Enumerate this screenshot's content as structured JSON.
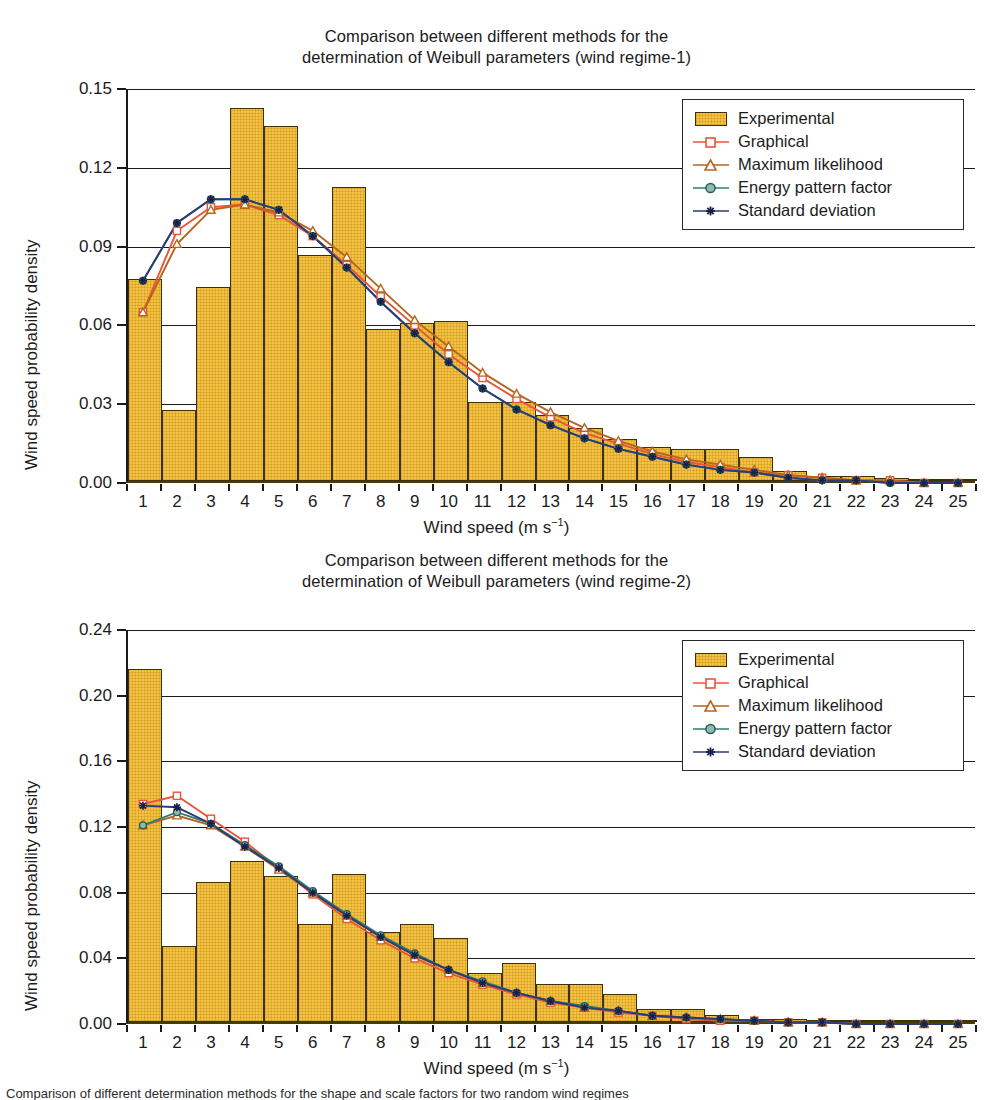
{
  "figure": {
    "caption": "Comparison of different determination methods for the shape and scale factors for two random wind regimes"
  },
  "legend": {
    "entries": [
      {
        "label": "Experimental",
        "type": "bar",
        "color": "#f5c243"
      },
      {
        "label": "Graphical",
        "type": "line",
        "color": "#e8553a",
        "marker": "open-square"
      },
      {
        "label": "Maximum likelihood",
        "type": "line",
        "color": "#b5651d",
        "marker": "open-triangle"
      },
      {
        "label": "Energy pattern factor",
        "type": "line",
        "color": "#2e7d74",
        "marker": "filled-circle"
      },
      {
        "label": "Standard deviation",
        "type": "line",
        "color": "#2b3a78",
        "marker": "asterisk"
      }
    ]
  },
  "chart_data": [
    {
      "type": "bar",
      "id": "wind-regime-1",
      "title": "Comparison between different methods for the determination of Weibull parameters (wind regime-1)",
      "title_line1": "Comparison between different methods for the",
      "title_line2": "determination of Weibull parameters (wind regime-1)",
      "xlabel": "Wind speed (m s−1)",
      "ylabel": "Wind speed probability density",
      "xlim": [
        0,
        25
      ],
      "ylim": [
        0.0,
        0.15
      ],
      "yticks": [
        "0.00",
        "0.03",
        "0.06",
        "0.09",
        "0.12",
        "0.15"
      ],
      "ytick_values": [
        0.0,
        0.03,
        0.06,
        0.09,
        0.12,
        0.15
      ],
      "grid": true,
      "legend_position": "top-right",
      "categories": [
        1,
        2,
        3,
        4,
        5,
        6,
        7,
        8,
        9,
        10,
        11,
        12,
        13,
        14,
        15,
        16,
        17,
        18,
        19,
        20,
        21,
        22,
        23,
        24,
        25
      ],
      "values": [
        0.077,
        0.027,
        0.074,
        0.142,
        0.135,
        0.086,
        0.112,
        0.058,
        0.06,
        0.061,
        0.03,
        0.03,
        0.025,
        0.02,
        0.016,
        0.013,
        0.012,
        0.012,
        0.009,
        0.004,
        0.002,
        0.002,
        0.001,
        0.0,
        0.0
      ],
      "series": [
        {
          "name": "Graphical",
          "color": "#e8553a",
          "marker": "open-square",
          "values": [
            0.065,
            0.096,
            0.105,
            0.106,
            0.102,
            0.094,
            0.083,
            0.071,
            0.06,
            0.049,
            0.04,
            0.032,
            0.025,
            0.019,
            0.015,
            0.011,
            0.008,
            0.006,
            0.004,
            0.003,
            0.002,
            0.001,
            0.001,
            0.0,
            0.0
          ]
        },
        {
          "name": "Maximum likelihood",
          "color": "#b5651d",
          "marker": "open-triangle",
          "values": [
            0.065,
            0.091,
            0.104,
            0.106,
            0.103,
            0.096,
            0.086,
            0.074,
            0.062,
            0.052,
            0.042,
            0.034,
            0.027,
            0.021,
            0.016,
            0.012,
            0.009,
            0.007,
            0.005,
            0.003,
            0.002,
            0.001,
            0.001,
            0.0,
            0.0
          ]
        },
        {
          "name": "Energy pattern factor",
          "color": "#2e7d74",
          "marker": "filled-circle",
          "values": [
            0.077,
            0.099,
            0.108,
            0.108,
            0.104,
            0.094,
            0.082,
            0.069,
            0.057,
            0.046,
            0.036,
            0.028,
            0.022,
            0.017,
            0.013,
            0.01,
            0.007,
            0.005,
            0.004,
            0.002,
            0.001,
            0.001,
            0.0,
            0.0,
            0.0
          ]
        },
        {
          "name": "Standard deviation",
          "color": "#2b3a78",
          "marker": "asterisk",
          "values": [
            0.077,
            0.099,
            0.108,
            0.108,
            0.104,
            0.094,
            0.082,
            0.069,
            0.057,
            0.046,
            0.036,
            0.028,
            0.022,
            0.017,
            0.013,
            0.01,
            0.007,
            0.005,
            0.004,
            0.002,
            0.001,
            0.001,
            0.0,
            0.0,
            0.0
          ]
        }
      ]
    },
    {
      "type": "bar",
      "id": "wind-regime-2",
      "title": "Comparison between different methods for the determination of Weibull parameters (wind regime-2)",
      "title_line1": "Comparison between different methods for the",
      "title_line2": "determination of Weibull parameters (wind regime-2)",
      "xlabel": "Wind speed (m s−1)",
      "ylabel": "Wind speed probability density",
      "xlim": [
        0,
        25
      ],
      "ylim": [
        0.0,
        0.24
      ],
      "yticks": [
        "0.00",
        "0.04",
        "0.08",
        "0.12",
        "0.16",
        "0.20",
        "0.24"
      ],
      "ytick_values": [
        0.0,
        0.04,
        0.08,
        0.12,
        0.16,
        0.2,
        0.24
      ],
      "grid": true,
      "legend_position": "top-right",
      "categories": [
        1,
        2,
        3,
        4,
        5,
        6,
        7,
        8,
        9,
        10,
        11,
        12,
        13,
        14,
        15,
        16,
        17,
        18,
        19,
        20,
        21,
        22,
        23,
        24,
        25
      ],
      "values": [
        0.215,
        0.046,
        0.085,
        0.098,
        0.089,
        0.06,
        0.09,
        0.055,
        0.06,
        0.051,
        0.03,
        0.036,
        0.023,
        0.023,
        0.017,
        0.008,
        0.008,
        0.004,
        0.002,
        0.002,
        0.001,
        0.001,
        0.001,
        0.0,
        0.0
      ],
      "series": [
        {
          "name": "Graphical",
          "color": "#e8553a",
          "marker": "open-square",
          "values": [
            0.134,
            0.139,
            0.125,
            0.111,
            0.095,
            0.079,
            0.064,
            0.051,
            0.04,
            0.031,
            0.024,
            0.018,
            0.013,
            0.01,
            0.007,
            0.005,
            0.003,
            0.002,
            0.002,
            0.001,
            0.001,
            0.0,
            0.0,
            0.0,
            0.0
          ]
        },
        {
          "name": "Maximum likelihood",
          "color": "#b5651d",
          "marker": "open-triangle",
          "values": [
            0.121,
            0.127,
            0.121,
            0.108,
            0.094,
            0.08,
            0.066,
            0.053,
            0.042,
            0.033,
            0.025,
            0.019,
            0.014,
            0.01,
            0.008,
            0.005,
            0.004,
            0.003,
            0.002,
            0.001,
            0.001,
            0.0,
            0.0,
            0.0,
            0.0
          ]
        },
        {
          "name": "Energy pattern factor",
          "color": "#2e7d74",
          "marker": "filled-circle",
          "values": [
            0.121,
            0.129,
            0.122,
            0.109,
            0.096,
            0.081,
            0.067,
            0.054,
            0.043,
            0.033,
            0.026,
            0.019,
            0.014,
            0.011,
            0.008,
            0.005,
            0.004,
            0.003,
            0.002,
            0.001,
            0.001,
            0.0,
            0.0,
            0.0,
            0.0
          ]
        },
        {
          "name": "Standard deviation",
          "color": "#2b3a78",
          "marker": "asterisk",
          "values": [
            0.133,
            0.132,
            0.122,
            0.108,
            0.095,
            0.08,
            0.066,
            0.053,
            0.042,
            0.033,
            0.025,
            0.019,
            0.014,
            0.01,
            0.008,
            0.005,
            0.004,
            0.003,
            0.002,
            0.001,
            0.001,
            0.0,
            0.0,
            0.0,
            0.0
          ]
        }
      ]
    }
  ]
}
